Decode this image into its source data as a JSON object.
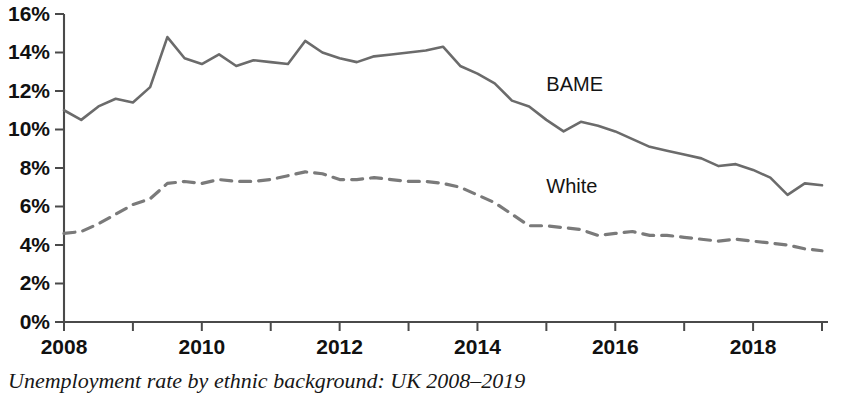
{
  "caption": "Unemployment rate by ethnic background: UK 2008–2019",
  "axes": {
    "y_tick_labels": [
      "16%",
      "14%",
      "12%",
      "10%",
      "8%",
      "6%",
      "4%",
      "2%",
      "0%"
    ],
    "x_tick_labels": [
      "2008",
      "2010",
      "2012",
      "2014",
      "2016",
      "2018"
    ]
  },
  "colors": {
    "bame_line": "#6b6b6b",
    "white_line": "#7a7a7a",
    "axis": "#4a4a4a",
    "text": "#111111",
    "background": "#ffffff"
  },
  "series_labels": {
    "bame": "BAME",
    "white": "White"
  },
  "chart_data": {
    "type": "line",
    "title": "Unemployment rate by ethnic background: UK 2008–2019",
    "xlabel": "",
    "ylabel": "",
    "xlim": [
      2008,
      2019
    ],
    "ylim": [
      0,
      16
    ],
    "y_unit": "%",
    "y_ticks": [
      0,
      2,
      4,
      6,
      8,
      10,
      12,
      14,
      16
    ],
    "y_tick_labels": [
      "0%",
      "2%",
      "4%",
      "6%",
      "8%",
      "10%",
      "12%",
      "14%",
      "16%"
    ],
    "x_ticks": [
      2008,
      2009,
      2010,
      2011,
      2012,
      2013,
      2014,
      2015,
      2016,
      2017,
      2018,
      2019
    ],
    "x_tick_labels": [
      "2008",
      "",
      "2010",
      "",
      "2012",
      "",
      "2014",
      "",
      "2016",
      "",
      "2018",
      ""
    ],
    "x_labeled_ticks": [
      2008,
      2010,
      2012,
      2014,
      2016,
      2018
    ],
    "grid": false,
    "legend": "inline-labels",
    "legend_position": "inside-right",
    "x": [
      2008.0,
      2008.25,
      2008.5,
      2008.75,
      2009.0,
      2009.25,
      2009.5,
      2009.75,
      2010.0,
      2010.25,
      2010.5,
      2010.75,
      2011.0,
      2011.25,
      2011.5,
      2011.75,
      2012.0,
      2012.25,
      2012.5,
      2012.75,
      2013.0,
      2013.25,
      2013.5,
      2013.75,
      2014.0,
      2014.25,
      2014.5,
      2014.75,
      2015.0,
      2015.25,
      2015.5,
      2015.75,
      2016.0,
      2016.25,
      2016.5,
      2016.75,
      2017.0,
      2017.25,
      2017.5,
      2017.75,
      2018.0,
      2018.25,
      2018.5,
      2018.75,
      2019.0
    ],
    "series": [
      {
        "name": "BAME",
        "style": "solid",
        "color": "#6b6b6b",
        "label_position": {
          "x": 2015.0,
          "y": 12.0
        },
        "values": [
          11.0,
          10.5,
          11.2,
          11.6,
          11.4,
          12.2,
          14.8,
          13.7,
          13.4,
          13.9,
          13.3,
          13.6,
          13.5,
          13.4,
          14.6,
          14.0,
          13.7,
          13.5,
          13.8,
          13.9,
          14.0,
          14.1,
          14.3,
          13.3,
          12.9,
          12.4,
          11.5,
          11.2,
          10.5,
          9.9,
          10.4,
          10.2,
          9.9,
          9.5,
          9.1,
          8.9,
          8.7,
          8.5,
          8.1,
          8.2,
          7.9,
          7.5,
          6.6,
          7.2,
          7.1
        ]
      },
      {
        "name": "White",
        "style": "dashed",
        "color": "#7a7a7a",
        "label_position": {
          "x": 2015.0,
          "y": 6.7
        },
        "values": [
          4.6,
          4.7,
          5.1,
          5.6,
          6.1,
          6.4,
          7.2,
          7.3,
          7.2,
          7.4,
          7.3,
          7.3,
          7.4,
          7.6,
          7.8,
          7.7,
          7.4,
          7.4,
          7.5,
          7.4,
          7.3,
          7.3,
          7.2,
          7.0,
          6.6,
          6.2,
          5.6,
          5.0,
          5.0,
          4.9,
          4.8,
          4.5,
          4.6,
          4.7,
          4.5,
          4.5,
          4.4,
          4.3,
          4.2,
          4.3,
          4.2,
          4.1,
          4.0,
          3.8,
          3.7
        ]
      }
    ]
  }
}
